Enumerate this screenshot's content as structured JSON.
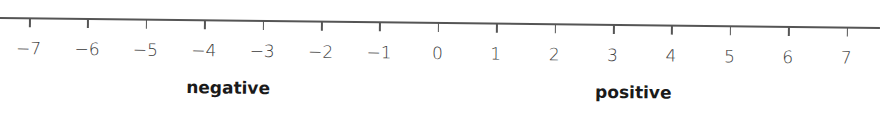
{
  "chart_data": {
    "type": "number-line",
    "min": -7,
    "max": 7,
    "step": 1,
    "ticks": [
      "−7",
      "−6",
      "−5",
      "−4",
      "−3",
      "−2",
      "−1",
      "0",
      "1",
      "2",
      "3",
      "4",
      "5",
      "6",
      "7"
    ],
    "annotations": [
      {
        "text": "negative",
        "position": "below -4 to -3"
      },
      {
        "text": "positive",
        "position": "below 3 to 4"
      }
    ]
  },
  "labels": {
    "negative": "negative",
    "positive": "positive"
  }
}
